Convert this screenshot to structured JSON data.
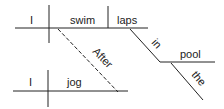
{
  "diagram": {
    "type": "sentence-diagram",
    "clauses": [
      {
        "subject": "I",
        "verb": "swim",
        "object": "laps",
        "modifiers": [
          {
            "prep": "in",
            "object": "pool",
            "article": "the"
          }
        ]
      },
      {
        "subject": "I",
        "verb": "jog"
      }
    ],
    "connector": "After",
    "words": {
      "subj1": "I",
      "verb1": "swim",
      "obj1": "laps",
      "prep": "in",
      "pobj": "pool",
      "art": "the",
      "conj": "After",
      "subj2": "I",
      "verb2": "jog"
    }
  }
}
